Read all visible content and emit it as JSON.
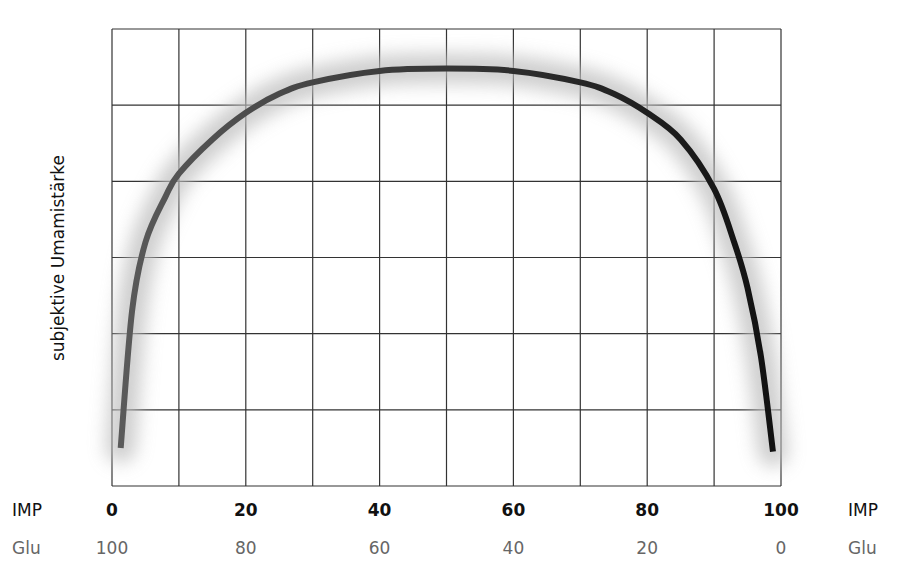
{
  "chart_data": {
    "type": "line",
    "title": "",
    "ylabel": "subjektive Umamistärke",
    "xlabel_primary": "IMP",
    "xlabel_secondary": "Glu",
    "x_ticks_primary": [
      "0",
      "20",
      "40",
      "60",
      "80",
      "100"
    ],
    "x_ticks_secondary": [
      "100",
      "80",
      "60",
      "40",
      "20",
      "0"
    ],
    "xlim": [
      0,
      100
    ],
    "ylim": [
      0,
      6
    ],
    "grid": true,
    "grid_columns": 10,
    "grid_rows": 6,
    "series": [
      {
        "name": "subjektive Umamistärke",
        "x": [
          1.3,
          3,
          5,
          8,
          10,
          15,
          20,
          25,
          30,
          40,
          50,
          60,
          70,
          75,
          80,
          85,
          90,
          93,
          95,
          97,
          98.8
        ],
        "values": [
          0.5,
          2.3,
          3.2,
          3.8,
          4.1,
          4.55,
          4.9,
          5.15,
          5.3,
          5.45,
          5.48,
          5.45,
          5.3,
          5.15,
          4.9,
          4.55,
          3.9,
          3.2,
          2.6,
          1.7,
          0.45
        ]
      }
    ],
    "curve_color_start": "#5a5a5a",
    "curve_color_end": "#111111",
    "glow_color": "#bdbdbd"
  },
  "labels": {
    "ylabel": "subjektive Umamistärke",
    "imp_left": "IMP",
    "imp_right": "IMP",
    "glu_left": "Glu",
    "glu_right": "Glu"
  }
}
